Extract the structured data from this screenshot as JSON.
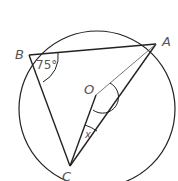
{
  "diagram": {
    "type": "circle-geometry",
    "circle": {
      "cx": 97,
      "cy": 109,
      "r": 78
    },
    "points": {
      "A": {
        "label": "A",
        "x": 156,
        "y": 44
      },
      "B": {
        "label": "B",
        "x": 29,
        "y": 55
      },
      "C": {
        "label": "C",
        "x": 70,
        "y": 166
      },
      "O": {
        "label": "O",
        "x": 96,
        "y": 95
      }
    },
    "segments": [
      "BA",
      "BC",
      "CA",
      "OC",
      "OA"
    ],
    "angles": {
      "B": {
        "label": "75°"
      },
      "C": {
        "label": "x"
      }
    },
    "colors": {
      "stroke": "#222222",
      "label": "#555555"
    }
  }
}
